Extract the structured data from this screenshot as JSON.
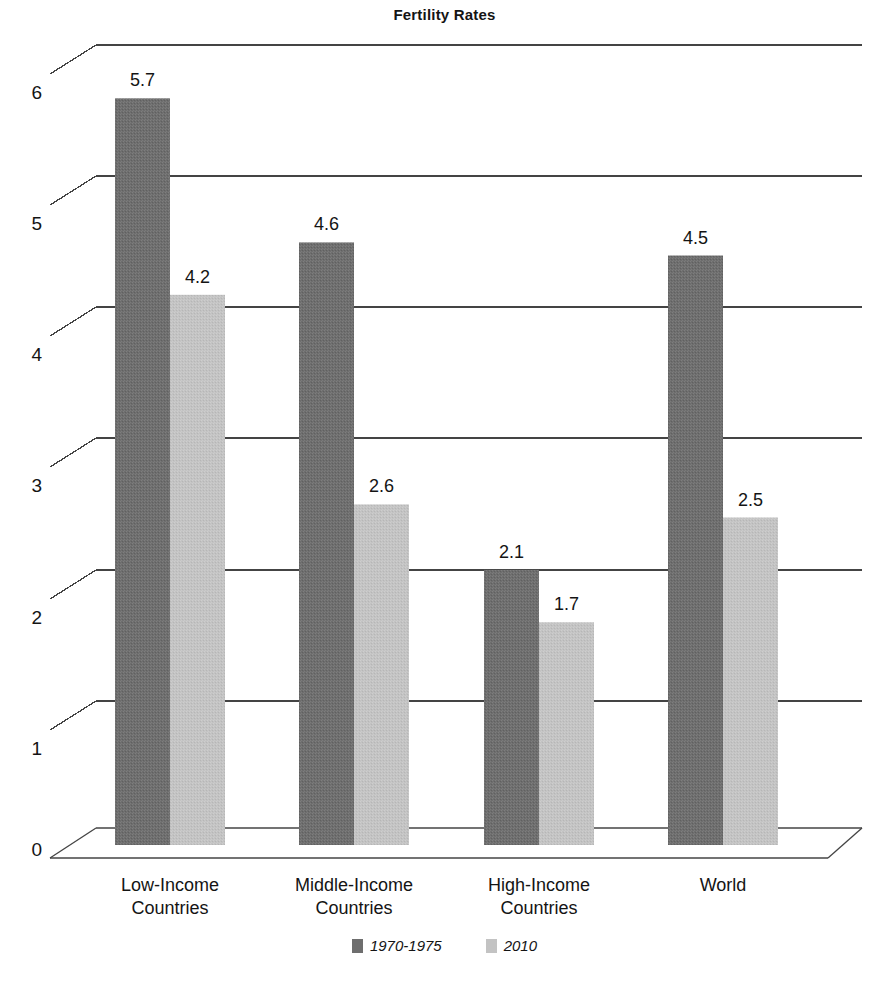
{
  "chart_data": {
    "type": "bar",
    "title": "Fertility Rates",
    "xlabel": "",
    "ylabel": "",
    "ylim": [
      0,
      6
    ],
    "yticks": [
      "0",
      "1",
      "2",
      "3",
      "4",
      "5",
      "6"
    ],
    "grid": true,
    "legend_position": "bottom",
    "categories": [
      "Low-Income Countries",
      "Middle-Income Countries",
      "High-Income Countries",
      "World"
    ],
    "category_lines": [
      [
        "Low-Income",
        "Countries"
      ],
      [
        "Middle-Income",
        "Countries"
      ],
      [
        "High-Income",
        "Countries"
      ],
      [
        "World",
        ""
      ]
    ],
    "series": [
      {
        "name": "1970-1975",
        "color": "#6e6e6e",
        "values": [
          5.7,
          4.6,
          2.1,
          4.5
        ],
        "labels": [
          "5.7",
          "4.6",
          "2.1",
          "4.5"
        ]
      },
      {
        "name": "2010",
        "color": "#c3c3c3",
        "values": [
          4.2,
          2.6,
          1.7,
          2.5
        ],
        "labels": [
          "4.2",
          "2.6",
          "1.7",
          "2.5"
        ]
      }
    ]
  },
  "legend": {
    "entries": [
      {
        "label": "1970-1975",
        "swatch": "series-a"
      },
      {
        "label": "2010",
        "swatch": "series-b"
      }
    ]
  },
  "colors": {
    "series_a": "#6e6e6e",
    "series_b": "#c3c3c3",
    "axis_line": "#444444",
    "text": "#141414",
    "background": "#ffffff"
  }
}
